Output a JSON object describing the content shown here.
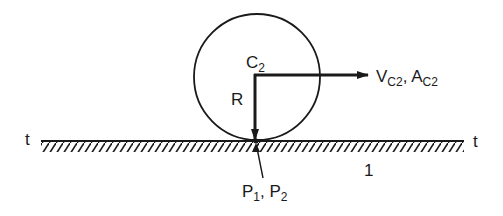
{
  "diagram": {
    "colors": {
      "ink": "#1a1a1a",
      "background": "#ffffff"
    },
    "labels": {
      "center": {
        "main": "C",
        "sub": "2"
      },
      "radius": "R",
      "vector": {
        "v_main": "V",
        "v_sub": "C2",
        "sep": ", ",
        "a_main": "A",
        "a_sub": "C2"
      },
      "tangent_left": "t",
      "tangent_right": "t",
      "ground": "1",
      "contact": {
        "p1_main": "P",
        "p1_sub": "1",
        "sep": ", ",
        "p2_main": "P",
        "p2_sub": "2"
      }
    },
    "shapes": {
      "circle": {
        "cx": 257,
        "cy": 77,
        "r": 63
      },
      "ground_line": {
        "x1": 41,
        "x2": 464,
        "y": 141
      },
      "radius_arrow": {
        "from": [
          255,
          75
        ],
        "to": [
          255,
          138
        ]
      },
      "velocity_arrow": {
        "from": [
          255,
          75
        ],
        "to": [
          368,
          75
        ]
      }
    }
  }
}
